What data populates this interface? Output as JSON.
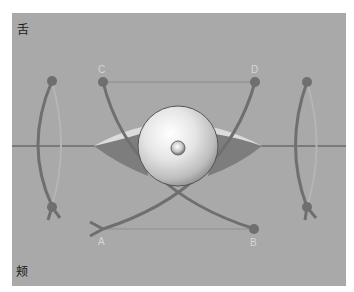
{
  "diagram": {
    "labels": {
      "top_left": "舌",
      "bottom_left": "颊"
    },
    "points": {
      "A": "A",
      "B": "B",
      "C": "C",
      "D": "D"
    },
    "colors": {
      "background": "#a9a9a9",
      "muscle": "#6f6f6f",
      "muscle_light": "#b5b5b5",
      "sclera": "#dcdcdc",
      "shadow": "#7d7d7d",
      "label": "#d6d6d6"
    }
  }
}
